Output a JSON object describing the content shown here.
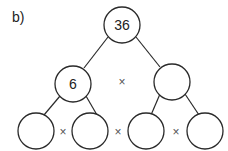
{
  "diagram": {
    "label": "b)",
    "type": "factor-tree",
    "operator_symbol": "×",
    "nodes": [
      {
        "id": "root",
        "value": "36",
        "cx": 122,
        "cy": 25
      },
      {
        "id": "mid-left",
        "value": "6",
        "cx": 73,
        "cy": 84
      },
      {
        "id": "mid-right",
        "value": "",
        "cx": 172,
        "cy": 82
      },
      {
        "id": "leaf-1",
        "value": "",
        "cx": 36,
        "cy": 131
      },
      {
        "id": "leaf-2",
        "value": "",
        "cx": 90,
        "cy": 131
      },
      {
        "id": "leaf-3",
        "value": "",
        "cx": 146,
        "cy": 131
      },
      {
        "id": "leaf-4",
        "value": "",
        "cx": 205,
        "cy": 131
      }
    ],
    "operators": [
      {
        "between": [
          "mid-left",
          "mid-right"
        ],
        "symbol": "×"
      },
      {
        "between": [
          "leaf-1",
          "leaf-2"
        ],
        "symbol": "×"
      },
      {
        "between": [
          "leaf-2",
          "leaf-3"
        ],
        "symbol": "×"
      },
      {
        "between": [
          "leaf-3",
          "leaf-4"
        ],
        "symbol": "×"
      }
    ]
  }
}
